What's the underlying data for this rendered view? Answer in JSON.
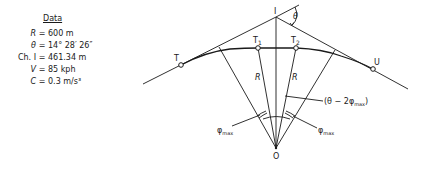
{
  "data_panel": {
    "title": "Data",
    "rows": [
      {
        "label": "R",
        "eq": "=",
        "value": "600 m"
      },
      {
        "label": "θ",
        "eq": "=",
        "value": "14° 28′ 26″"
      },
      {
        "label": "Ch. I",
        "eq": "=",
        "value": "461.34 m"
      },
      {
        "label": "V",
        "eq": "=",
        "value": "85 kph"
      },
      {
        "label": "C",
        "eq": "=",
        "value": "0.3 m/s³"
      }
    ]
  },
  "diagram": {
    "points": {
      "I": "I",
      "T": "T",
      "T1": "T",
      "T1_sub": "1",
      "T2": "T",
      "T2_sub": "2",
      "U": "U",
      "O": "O"
    },
    "labels": {
      "theta": "θ",
      "R_left": "R",
      "R_right": "R",
      "phi_left": "φ",
      "phi_left_sub": "max",
      "phi_right": "φ",
      "phi_right_sub": "max",
      "center_angle_open": "(θ − 2",
      "center_angle_phi": "φ",
      "center_angle_sub": "max",
      "center_angle_close": ")"
    },
    "colors": {
      "line": "#1a1a1a",
      "background": "#ffffff"
    }
  }
}
